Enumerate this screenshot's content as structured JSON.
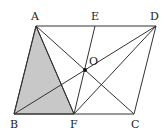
{
  "figure": {
    "type": "parallelogram-geometry",
    "points": {
      "A": {
        "label": "A",
        "x": 36,
        "y": 26,
        "lx": 31,
        "ly": 20
      },
      "E": {
        "label": "E",
        "x": 95,
        "y": 26,
        "lx": 91,
        "ly": 20
      },
      "D": {
        "label": "D",
        "x": 156,
        "y": 26,
        "lx": 150,
        "ly": 20
      },
      "B": {
        "label": "B",
        "x": 14,
        "y": 114,
        "lx": 10,
        "ly": 128
      },
      "F": {
        "label": "F",
        "x": 74,
        "y": 114,
        "lx": 70,
        "ly": 128
      },
      "C": {
        "label": "C",
        "x": 134,
        "y": 114,
        "lx": 131,
        "ly": 128
      },
      "O": {
        "label": "O",
        "x": 85,
        "y": 70,
        "lx": 89,
        "ly": 65
      }
    },
    "shaded_region": [
      "A",
      "B",
      "F"
    ],
    "shade_color": "#c8c8c8",
    "segments": [
      [
        "A",
        "D"
      ],
      [
        "D",
        "C"
      ],
      [
        "C",
        "B"
      ],
      [
        "B",
        "A"
      ],
      [
        "A",
        "F"
      ],
      [
        "A",
        "C"
      ],
      [
        "B",
        "D"
      ],
      [
        "E",
        "F"
      ],
      [
        "D",
        "F"
      ]
    ]
  }
}
